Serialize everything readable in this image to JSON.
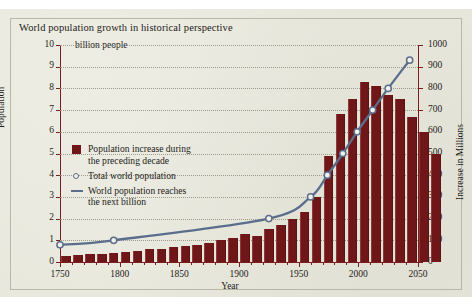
{
  "figure": {
    "title": "World population growth in historical perspective",
    "unit_note": "billion people",
    "xlabel": "Year",
    "ylabel_left": "Population",
    "ylabel_right": "Increase in Millions"
  },
  "legend": {
    "items": [
      {
        "marker": "swatch",
        "line1": "Population increase during",
        "line2": "the preceding decade"
      },
      {
        "marker": "circle",
        "line1": "Total world population",
        "line2": ""
      },
      {
        "marker": "line",
        "line1": "World population reaches",
        "line2": "the next billion"
      }
    ]
  },
  "colors": {
    "bar": "#6e1618",
    "line": "#5a6e8c",
    "marker_fill": "#f2f1e8",
    "page": "#e9e8dd",
    "axis": "#7c1d20",
    "grid": "#9d9b8c",
    "frame": "#b9b7a6",
    "text": "#1d1b18"
  },
  "chart_data": {
    "type": "bar",
    "title": "World population growth in historical perspective",
    "subtitle": "billion people",
    "xlabel": "Year",
    "ylabel": "Population",
    "ylabel_secondary": "Increase in Millions",
    "xlim": [
      1750,
      2050
    ],
    "ylim": [
      0,
      10
    ],
    "ylim_secondary": [
      0,
      1000
    ],
    "grid": true,
    "legend_position": "inside-left",
    "x_ticks": [
      1750,
      1800,
      1850,
      1900,
      1950,
      2000,
      2050
    ],
    "y_ticks_left": [
      0,
      1,
      2,
      3,
      4,
      5,
      6,
      7,
      8,
      9,
      10
    ],
    "y_ticks_right": [
      0,
      100,
      200,
      300,
      400,
      500,
      600,
      700,
      800,
      900,
      1000
    ],
    "series": [
      {
        "name": "Population increase during the preceding decade",
        "type": "bar",
        "unit": "millions",
        "axis": "right",
        "categories": [
          "1750s",
          "1760s",
          "1770s",
          "1780s",
          "1790s",
          "1800s",
          "1810s",
          "1820s",
          "1830s",
          "1840s",
          "1850s",
          "1860s",
          "1870s",
          "1880s",
          "1890s",
          "1900s",
          "1910s",
          "1920s",
          "1930s",
          "1940s",
          "1950s",
          "1960s",
          "1970s",
          "1980s",
          "1990s",
          "2000s",
          "2010s",
          "2020s",
          "2030s",
          "2040s"
        ],
        "values": [
          30,
          32,
          36,
          38,
          40,
          48,
          52,
          58,
          62,
          68,
          74,
          80,
          88,
          100,
          112,
          130,
          118,
          150,
          170,
          200,
          230,
          300,
          490,
          680,
          750,
          830,
          810,
          770,
          750,
          670
        ],
        "values_tail": [
          600,
          500
        ]
      },
      {
        "name": "Total world population",
        "type": "line",
        "unit": "billions",
        "axis": "left",
        "x": [
          1750,
          1795,
          1925,
          1960,
          1974,
          1987,
          1999,
          2012,
          2025,
          2043
        ],
        "values": [
          0.79,
          1.0,
          2.0,
          3.0,
          4.0,
          5.0,
          6.0,
          7.0,
          8.0,
          9.3
        ],
        "markers": "open-circle"
      }
    ],
    "annotations": [
      "Circles mark the year the world population reaches each next billion"
    ]
  }
}
